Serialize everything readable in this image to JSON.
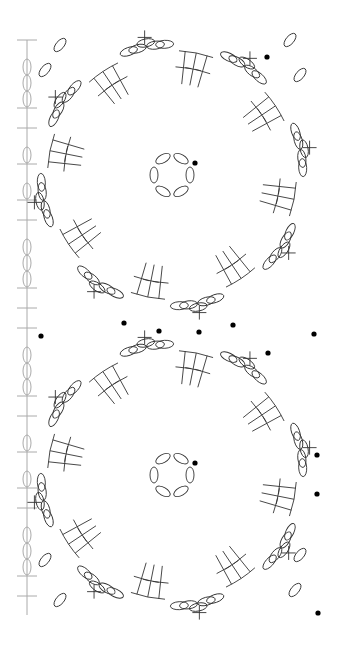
{
  "diagram": {
    "title": "",
    "width": 344,
    "height": 646,
    "colors": {
      "stroke": "#333333",
      "strip": "#aaaaaa",
      "marker": "#000000",
      "background": "#ffffff"
    },
    "legend_symbols": {
      "chain": "oval",
      "single_crochet": "plus",
      "double_crochet": "T-bar",
      "start_marker": "filled-dot"
    },
    "motifs": [
      {
        "name": "top-motif",
        "cx": 172,
        "cy": 175,
        "ring_r": 18,
        "ring_chains": 6,
        "outer_r": 138,
        "dc_groups": 8,
        "marker_angle": -40
      },
      {
        "name": "bottom-motif",
        "cx": 172,
        "cy": 475,
        "ring_r": 18,
        "ring_chains": 6,
        "outer_r": 138,
        "dc_groups": 8,
        "marker_angle": -40
      }
    ],
    "left_strip": {
      "x": 27,
      "y_start": 40,
      "y_end": 615
    },
    "markers": [
      {
        "x": 267,
        "y": 57
      },
      {
        "x": 195,
        "y": 163
      },
      {
        "x": 124,
        "y": 323
      },
      {
        "x": 159,
        "y": 331
      },
      {
        "x": 199,
        "y": 332
      },
      {
        "x": 233,
        "y": 325
      },
      {
        "x": 268,
        "y": 353
      },
      {
        "x": 314,
        "y": 334
      },
      {
        "x": 41,
        "y": 336
      },
      {
        "x": 195,
        "y": 463
      },
      {
        "x": 317,
        "y": 455
      },
      {
        "x": 317,
        "y": 494
      },
      {
        "x": 318,
        "y": 613
      }
    ]
  }
}
